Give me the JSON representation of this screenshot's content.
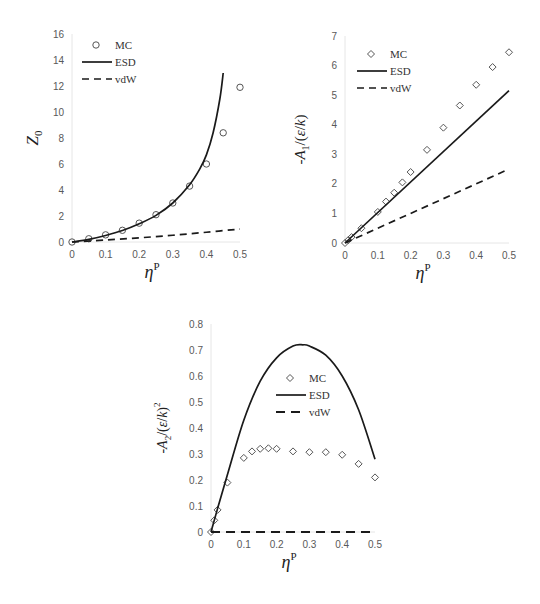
{
  "chart_data": [
    {
      "type": "line",
      "id": "z0",
      "title": "",
      "xlabel": "η^P",
      "ylabel": "Z_0",
      "xlim": [
        0,
        0.5
      ],
      "ylim": [
        0,
        16
      ],
      "xticks": [
        "0",
        "0.1",
        "0.2",
        "0.3",
        "0.4",
        "0.5"
      ],
      "yticks": [
        "0",
        "2",
        "4",
        "6",
        "8",
        "10",
        "12",
        "14",
        "16"
      ],
      "grid": false,
      "legend_position": "upper-left",
      "legend": [
        "MC",
        "ESD",
        "vdW"
      ],
      "series": [
        {
          "name": "MC",
          "style": "circle-markers",
          "x": [
            0,
            0.05,
            0.1,
            0.15,
            0.2,
            0.25,
            0.3,
            0.35,
            0.4,
            0.45,
            0.5
          ],
          "values": [
            0,
            0.25,
            0.55,
            0.9,
            1.45,
            2.1,
            3.0,
            4.3,
            6.0,
            8.4,
            11.9
          ]
        },
        {
          "name": "ESD",
          "style": "solid",
          "x": [
            0,
            0.05,
            0.1,
            0.15,
            0.2,
            0.25,
            0.3,
            0.35,
            0.38,
            0.4,
            0.42,
            0.44,
            0.45
          ],
          "values": [
            0,
            0.2,
            0.5,
            0.88,
            1.4,
            2.05,
            3.0,
            4.4,
            5.6,
            6.7,
            8.4,
            11.0,
            13.0
          ]
        },
        {
          "name": "vdW",
          "style": "dashed",
          "x": [
            0,
            0.1,
            0.2,
            0.3,
            0.4,
            0.5
          ],
          "values": [
            0,
            0.15,
            0.32,
            0.52,
            0.75,
            1.0
          ]
        }
      ]
    },
    {
      "type": "line",
      "id": "a1",
      "title": "",
      "xlabel": "η^P",
      "ylabel": "-A_1/(ε/k)",
      "xlim": [
        0,
        0.5
      ],
      "ylim": [
        0,
        7
      ],
      "xticks": [
        "0",
        "0.1",
        "0.2",
        "0.3",
        "0.4",
        "0.5"
      ],
      "yticks": [
        "0",
        "1",
        "2",
        "3",
        "4",
        "5",
        "6",
        "7"
      ],
      "grid": false,
      "legend_position": "upper-left",
      "legend": [
        "MC",
        "ESD",
        "vdW"
      ],
      "series": [
        {
          "name": "MC",
          "style": "diamond-markers",
          "x": [
            0,
            0.01,
            0.02,
            0.05,
            0.1,
            0.125,
            0.15,
            0.175,
            0.2,
            0.25,
            0.3,
            0.35,
            0.4,
            0.45,
            0.5
          ],
          "values": [
            0,
            0.1,
            0.2,
            0.5,
            1.05,
            1.4,
            1.7,
            2.05,
            2.4,
            3.15,
            3.9,
            4.65,
            5.35,
            5.95,
            6.45
          ]
        },
        {
          "name": "ESD",
          "style": "solid",
          "x": [
            0,
            0.5
          ],
          "values": [
            0,
            5.15
          ]
        },
        {
          "name": "vdW",
          "style": "dashed",
          "x": [
            0,
            0.5
          ],
          "values": [
            0,
            2.5
          ]
        }
      ]
    },
    {
      "type": "line",
      "id": "a2",
      "title": "",
      "xlabel": "η^P",
      "ylabel": "-A_2/(ε/k)^2",
      "xlim": [
        0,
        0.5
      ],
      "ylim": [
        0,
        0.8
      ],
      "xticks": [
        "0",
        "0.1",
        "0.2",
        "0.3",
        "0.4",
        "0.5"
      ],
      "yticks": [
        "0",
        "0.1",
        "0.2",
        "0.3",
        "0.4",
        "0.5",
        "0.6",
        "0.7",
        "0.8"
      ],
      "grid": false,
      "legend_position": "center",
      "legend": [
        "MC",
        "ESD",
        "vdW"
      ],
      "series": [
        {
          "name": "MC",
          "style": "diamond-markers",
          "x": [
            0,
            0.01,
            0.02,
            0.05,
            0.1,
            0.125,
            0.15,
            0.175,
            0.2,
            0.25,
            0.3,
            0.35,
            0.4,
            0.45,
            0.5
          ],
          "values": [
            0,
            0.045,
            0.085,
            0.19,
            0.285,
            0.31,
            0.32,
            0.322,
            0.32,
            0.31,
            0.307,
            0.307,
            0.297,
            0.262,
            0.21
          ]
        },
        {
          "name": "ESD",
          "style": "solid",
          "x": [
            0,
            0.02,
            0.05,
            0.1,
            0.15,
            0.2,
            0.25,
            0.28,
            0.3,
            0.35,
            0.4,
            0.45,
            0.5
          ],
          "values": [
            0,
            0.09,
            0.22,
            0.43,
            0.58,
            0.67,
            0.715,
            0.72,
            0.715,
            0.68,
            0.6,
            0.47,
            0.28
          ]
        },
        {
          "name": "vdW",
          "style": "dashed",
          "x": [
            0,
            0.5
          ],
          "values": [
            0,
            0
          ]
        }
      ]
    }
  ],
  "layout": [
    {
      "left": 72,
      "right": 240,
      "top": 34,
      "bottom": 242
    },
    {
      "left": 345,
      "right": 509,
      "top": 36,
      "bottom": 243
    },
    {
      "left": 211,
      "right": 375,
      "top": 324,
      "bottom": 532
    }
  ],
  "legends": [
    {
      "x": 82,
      "y": 45,
      "labels": [
        "MC",
        "ESD",
        "vdW"
      ]
    },
    {
      "x": 357,
      "y": 54,
      "labels": [
        "MC",
        "ESD",
        "vdW"
      ]
    },
    {
      "x": 276,
      "y": 378,
      "labels": [
        "MC",
        "ESD",
        "vdW"
      ]
    }
  ]
}
